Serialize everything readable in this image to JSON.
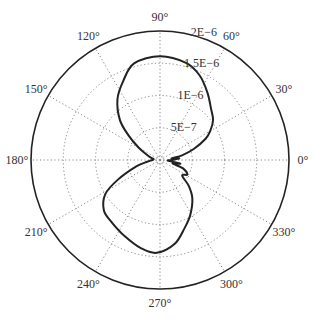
{
  "chart_data": {
    "type": "polar-line",
    "title": "",
    "angular_unit": "degrees",
    "angular_ticks": [
      0,
      30,
      60,
      90,
      120,
      150,
      180,
      210,
      240,
      270,
      300,
      330
    ],
    "angular_tick_labels": [
      "0°",
      "30°",
      "60°",
      "90°",
      "120°",
      "150°",
      "180°",
      "210°",
      "240°",
      "270°",
      "300°",
      "330°"
    ],
    "radial_ticks": [
      5e-07,
      1e-06,
      1.5e-06,
      2e-06
    ],
    "radial_tick_labels": [
      "5E−7",
      "1E−6",
      "1.5E−6",
      "2E−6"
    ],
    "rlim": [
      0,
      2e-06
    ],
    "grid": true,
    "grid_style": "dotted",
    "series": [
      {
        "name": "pattern",
        "color": "#222222",
        "line_style": "solid-dotted-markers",
        "theta": [
          0,
          5,
          8,
          12,
          18,
          25,
          30,
          37,
          45,
          55,
          65,
          75,
          90,
          105,
          115,
          125,
          135,
          142,
          150,
          158,
          165,
          172,
          180,
          188,
          195,
          205,
          212,
          222,
          232,
          245,
          258,
          268,
          280,
          290,
          299,
          310,
          318,
          325,
          332,
          340,
          345,
          350,
          355,
          360
        ],
        "r": [
          2e-07,
          3e-07,
          1.8e-07,
          3.5e-07,
          5.5e-07,
          7.8e-07,
          9e-07,
          1.03e-06,
          1.12e-06,
          1.28e-06,
          1.45e-06,
          1.56e-06,
          1.61e-06,
          1.55e-06,
          1.35e-06,
          1.15e-06,
          8.8e-07,
          6.2e-07,
          3.8e-07,
          2.2e-07,
          1.5e-07,
          1e-07,
          1.2e-07,
          2e-07,
          3.8e-07,
          7.2e-07,
          1e-06,
          1.17e-06,
          1.22e-06,
          1.3e-06,
          1.4e-06,
          1.44e-06,
          1.32e-06,
          1.12e-06,
          9.7e-07,
          7.8e-07,
          6e-07,
          4.2e-07,
          4.8e-07,
          3.8e-07,
          2e-07,
          3.2e-07,
          1.2e-07,
          2e-07
        ]
      }
    ]
  },
  "layout": {
    "center_x": 160,
    "center_y": 160,
    "outer_radius_px": 129,
    "angle_label_offset_px": 14
  }
}
